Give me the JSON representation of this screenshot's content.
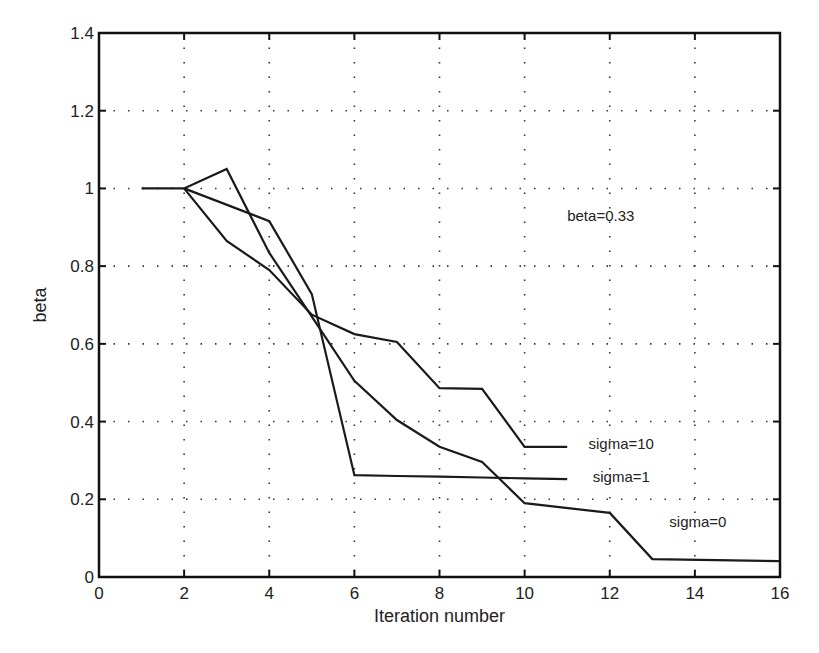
{
  "chart_data": {
    "type": "line",
    "title": "",
    "xlabel": "Iteration number",
    "ylabel": "beta",
    "xlim": [
      0,
      16
    ],
    "ylim": [
      0,
      1.4
    ],
    "xticks": [
      0,
      2,
      4,
      6,
      8,
      10,
      12,
      14,
      16
    ],
    "yticks": [
      0,
      0.2,
      0.4,
      0.6,
      0.8,
      1,
      1.2,
      1.4
    ],
    "xtick_labels": [
      "0",
      "2",
      "4",
      "6",
      "8",
      "10",
      "12",
      "14",
      "16"
    ],
    "ytick_labels": [
      "0",
      "0.2",
      "0.4",
      "0.6",
      "0.8",
      "1",
      "1.2",
      "1.4"
    ],
    "grid": true,
    "line_color": "#1a1a1a",
    "series": [
      {
        "name": "sigma=0",
        "x": [
          1,
          2,
          3,
          4,
          5,
          6,
          7,
          8,
          9,
          10,
          12,
          13,
          16
        ],
        "y": [
          1.0,
          1.0,
          1.05,
          0.834,
          0.67,
          0.505,
          0.404,
          0.335,
          0.296,
          0.19,
          0.165,
          0.046,
          0.041
        ]
      },
      {
        "name": "sigma=1",
        "x": [
          2,
          4,
          5,
          6,
          7,
          8,
          9,
          10,
          11
        ],
        "y": [
          1.0,
          0.916,
          0.728,
          0.262,
          0.26,
          0.258,
          0.256,
          0.254,
          0.252
        ]
      },
      {
        "name": "sigma=10",
        "x": [
          2,
          3,
          4,
          5,
          6,
          7,
          8,
          9,
          10,
          11
        ],
        "y": [
          1.0,
          0.865,
          0.79,
          0.675,
          0.625,
          0.605,
          0.486,
          0.484,
          0.335,
          0.335
        ]
      }
    ],
    "annotations": [
      {
        "text": "beta=0.33",
        "x": 11.0,
        "y": 0.915
      },
      {
        "text": "sigma=10",
        "x": 11.5,
        "y": 0.33
      },
      {
        "text": "sigma=1",
        "x": 11.6,
        "y": 0.245
      },
      {
        "text": "sigma=0",
        "x": 13.4,
        "y": 0.128
      }
    ]
  }
}
